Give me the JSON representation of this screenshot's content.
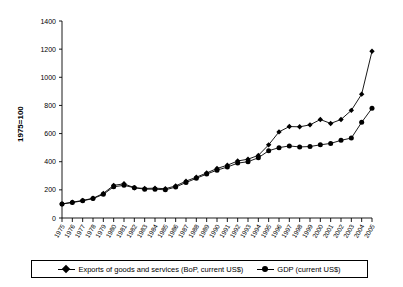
{
  "chart_data": {
    "type": "line",
    "title": "",
    "xlabel": "",
    "ylabel": "1975=100",
    "ylim": [
      0,
      1400
    ],
    "ytick_step": 200,
    "yticks": [
      0,
      200,
      400,
      600,
      800,
      1000,
      1200,
      1400
    ],
    "grid": false,
    "legend_position": "bottom",
    "x": [
      1975,
      1976,
      1977,
      1978,
      1979,
      1980,
      1981,
      1982,
      1983,
      1984,
      1985,
      1986,
      1987,
      1988,
      1989,
      1990,
      1991,
      1992,
      1993,
      1994,
      1995,
      1996,
      1997,
      1998,
      1999,
      2000,
      2001,
      2002,
      2003,
      2004,
      2005
    ],
    "categories": [
      "1975",
      "1976",
      "1977",
      "1978",
      "1979",
      "1980",
      "1981",
      "1982",
      "1983",
      "1984",
      "1985",
      "1986",
      "1987",
      "1988",
      "1989",
      "1990",
      "1991",
      "1992",
      "1993",
      "1994",
      "1995",
      "1996",
      "1997",
      "1998",
      "1999",
      "2000",
      "2001",
      "2002",
      "2003",
      "2004",
      "2005"
    ],
    "series": [
      {
        "name": "Exports of goods and services (BoP, current US$)",
        "marker": "diamond",
        "color": "#000000",
        "values": [
          100,
          112,
          125,
          140,
          175,
          232,
          243,
          215,
          210,
          212,
          208,
          228,
          262,
          290,
          320,
          352,
          375,
          405,
          418,
          445,
          520,
          612,
          650,
          648,
          662,
          700,
          672,
          700,
          765,
          880,
          1185
        ]
      },
      {
        "name": "GDP (current US$)",
        "marker": "circle",
        "color": "#000000",
        "values": [
          100,
          110,
          122,
          138,
          168,
          222,
          232,
          215,
          205,
          205,
          200,
          220,
          252,
          282,
          312,
          340,
          362,
          390,
          400,
          428,
          478,
          500,
          512,
          505,
          508,
          520,
          530,
          552,
          568,
          680,
          780
        ]
      }
    ]
  },
  "legend": {
    "entries": [
      {
        "label": "Exports of goods and services (BoP, current US$)",
        "marker": "diamond-marker-icon"
      },
      {
        "label": "GDP (current US$)",
        "marker": "circle-marker-icon"
      }
    ]
  },
  "axis": {
    "y_title": "1975=100"
  }
}
